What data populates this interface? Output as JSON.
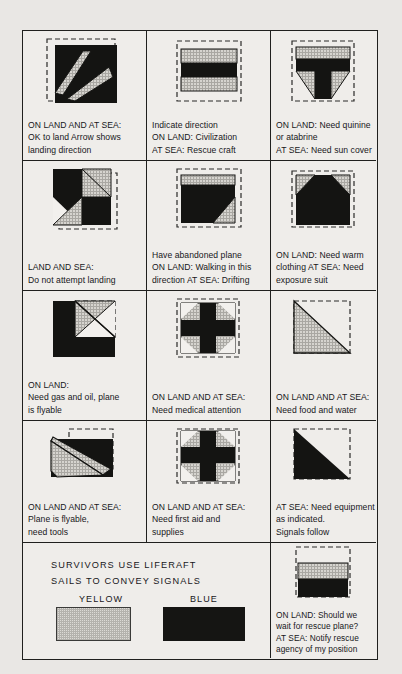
{
  "grid": {
    "rows": [
      {
        "cells": [
          {
            "symbol": "ok-to-land-arrow",
            "lines": [
              "ON LAND AND AT SEA:",
              "OK to land  Arrow shows",
              "landing direction"
            ]
          },
          {
            "symbol": "indicate-direction-bars",
            "lines": [
              "Indicate direction",
              "ON LAND: Civilization",
              "AT SEA: Rescue craft"
            ]
          },
          {
            "symbol": "need-quinine-tee",
            "lines": [
              "ON LAND: Need quinine",
              "or atabrine",
              "AT SEA: Need sun cover"
            ]
          }
        ]
      },
      {
        "cells": [
          {
            "symbol": "do-not-land-checker",
            "lines": [
              "LAND AND SEA:",
              "Do not attempt landing"
            ]
          },
          {
            "symbol": "abandoned-plane-block",
            "lines": [
              "Have abandoned plane",
              "ON LAND: Walking in this",
              "direction AT SEA: Drifting"
            ]
          },
          {
            "symbol": "need-warm-clothing-house",
            "lines": [
              "ON LAND: Need warm",
              "clothing    AT SEA: Need",
              "exposure suit"
            ]
          }
        ]
      },
      {
        "cells": [
          {
            "symbol": "need-gas-oil-notch",
            "lines": [
              "ON LAND:",
              "Need gas and oil, plane",
              "is flyable"
            ]
          },
          {
            "symbol": "need-medical-cross",
            "lines": [
              "ON LAND AND AT SEA:",
              "Need medical attention"
            ]
          },
          {
            "symbol": "need-food-water-triangle",
            "lines": [
              "ON LAND AND AT SEA:",
              "Need food and water"
            ]
          }
        ]
      },
      {
        "cells": [
          {
            "symbol": "plane-flyable-wedge",
            "lines": [
              "ON LAND AND AT SEA:",
              "Plane is flyable,",
              "need tools"
            ]
          },
          {
            "symbol": "need-first-aid-cross",
            "lines": [
              "ON LAND AND AT SEA:",
              "Need first aid and",
              "supplies"
            ]
          },
          {
            "symbol": "need-equipment-triangle",
            "lines": [
              "AT SEA: Need equipment",
              "as indicated.",
              "Signals follow"
            ]
          }
        ]
      }
    ]
  },
  "liferaft": {
    "title_lines": [
      "SURVIVORS USE LIFERAFT",
      "SAILS TO CONVEY SIGNALS"
    ],
    "swatches": [
      {
        "label": "YELLOW",
        "color": "#dcdad6"
      },
      {
        "label": "BLUE",
        "color": "#151513"
      }
    ],
    "last_cell": {
      "symbol": "wait-for-rescue-bars",
      "lines": [
        "ON LAND: Should we",
        "wait for rescue plane?",
        "AT SEA: Notify rescue",
        "agency of my position"
      ]
    }
  },
  "colors": {
    "ink": "#17171a",
    "fill_black": "#141412",
    "fill_hatch": "#d6d4cf",
    "paper": "#efedea",
    "backdrop": "#e9e7e4",
    "dash_border": "#2a2a28"
  }
}
